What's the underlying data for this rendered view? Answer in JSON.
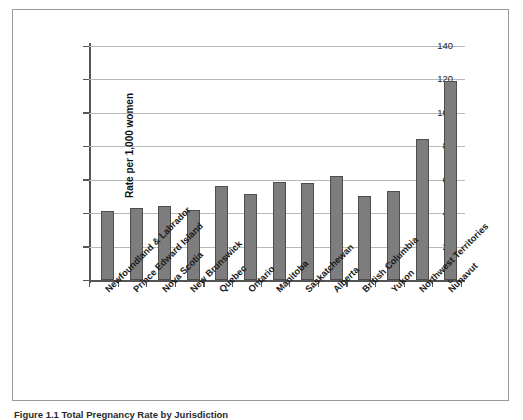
{
  "chart_data": {
    "type": "bar",
    "title": "",
    "xlabel": "",
    "ylabel": "Rate per 1,000 women",
    "ylim": [
      0,
      140
    ],
    "yticks": [
      0,
      20,
      40,
      60,
      80,
      100,
      120,
      140
    ],
    "grid": true,
    "legend": false,
    "categories": [
      "Newfoundland & Labrador",
      "Prince Edward Island",
      "Nova Scotia",
      "New Brunswick",
      "Quebec",
      "Ontario",
      "Manitoba",
      "Saskatchewan",
      "Alberta",
      "British Columbia",
      "Yukon",
      "Northwest Territories",
      "Nunavut"
    ],
    "values": [
      41.5,
      43,
      44.5,
      42,
      56.5,
      51.5,
      58.5,
      58,
      62.5,
      50.5,
      53.5,
      84.5,
      119
    ],
    "bar_color": "#7d7d7d",
    "bar_edge_color": "#4d4d4d",
    "grid_color": "#b9b9b9",
    "axis_color": "#555555"
  },
  "figure": {
    "caption": "Figure 1.1  Total Pregnancy Rate by Jurisdiction"
  }
}
